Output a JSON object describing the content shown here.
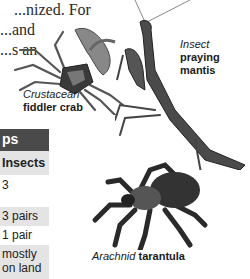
{
  "body_text": {
    "lines": [
      "...nized. For",
      "...and",
      "...s an",
      "",
      "",
      "...",
      "...li"
    ]
  },
  "captions": {
    "crab": {
      "group": "Crustacean",
      "name": "fiddler crab"
    },
    "mantis": {
      "group": "Insect",
      "name_line1": "praying",
      "name_line2": "mantis"
    },
    "tarantula": {
      "group": "Arachnid",
      "name": "tarantula"
    }
  },
  "table": {
    "title": "ps",
    "column_header": "Insects",
    "rows": [
      {
        "value": "3"
      },
      {
        "value": "3 pairs"
      },
      {
        "value": "1 pair"
      },
      {
        "value_line1": "mostly",
        "value_line2": "on land"
      }
    ]
  },
  "colors": {
    "table_header_bg": "#4a4a4a",
    "row_shade": "#e4e4e4"
  }
}
